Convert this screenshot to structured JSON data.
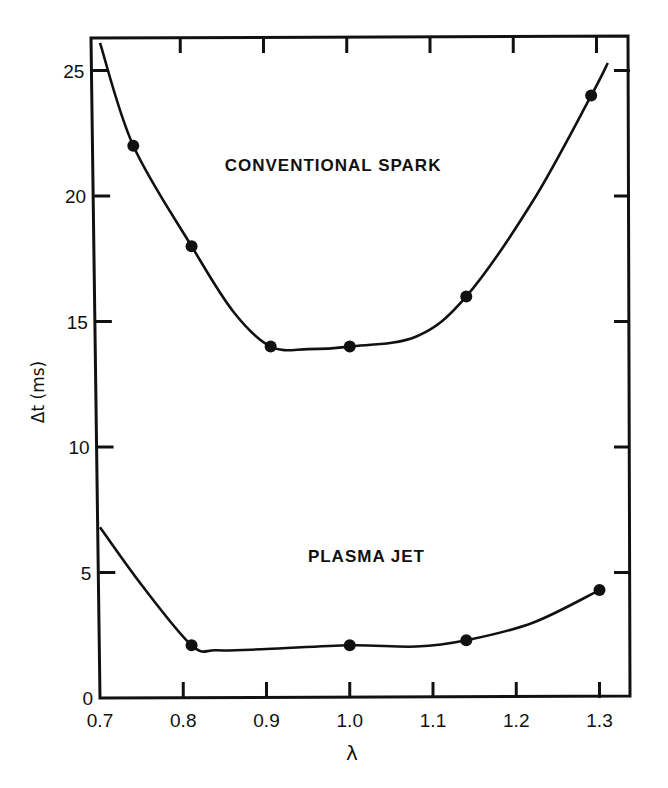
{
  "chart_data": {
    "type": "line",
    "title": "",
    "xlabel": "λ",
    "ylabel": "Δt (ms)",
    "xlim": [
      0.7,
      1.335
    ],
    "ylim": [
      0,
      26.5
    ],
    "x_ticks": [
      0.7,
      0.8,
      0.9,
      1.0,
      1.1,
      1.2,
      1.3
    ],
    "x_tick_labels": [
      "0.7",
      "0.8",
      "0.9",
      "1.0",
      "1.1",
      "1.2",
      "1.3"
    ],
    "y_ticks": [
      0,
      5,
      10,
      15,
      20,
      25
    ],
    "y_tick_labels": [
      "0",
      "5",
      "10",
      "15",
      "20",
      "25"
    ],
    "grid": false,
    "legend": "none (series labeled inline)",
    "series": [
      {
        "name": "CONVENTIONAL SPARK",
        "points": [
          {
            "x": 0.74,
            "y": 22.0
          },
          {
            "x": 0.81,
            "y": 18.0
          },
          {
            "x": 0.905,
            "y": 14.0
          },
          {
            "x": 1.0,
            "y": 14.0
          },
          {
            "x": 1.14,
            "y": 16.0
          },
          {
            "x": 1.29,
            "y": 24.0
          }
        ],
        "curve": [
          [
            0.7,
            26.1
          ],
          [
            0.74,
            22.0
          ],
          [
            0.81,
            18.0
          ],
          [
            0.86,
            15.4
          ],
          [
            0.905,
            14.0
          ],
          [
            0.95,
            13.9
          ],
          [
            1.0,
            14.0
          ],
          [
            1.08,
            14.4
          ],
          [
            1.14,
            16.0
          ],
          [
            1.22,
            19.8
          ],
          [
            1.29,
            24.0
          ],
          [
            1.31,
            25.3
          ]
        ]
      },
      {
        "name": "PLASMA JET",
        "points": [
          {
            "x": 0.81,
            "y": 2.1
          },
          {
            "x": 1.0,
            "y": 2.1
          },
          {
            "x": 1.14,
            "y": 2.3
          },
          {
            "x": 1.3,
            "y": 4.3
          }
        ],
        "curve": [
          [
            0.7,
            6.8
          ],
          [
            0.75,
            4.5
          ],
          [
            0.81,
            2.1
          ],
          [
            0.84,
            1.9
          ],
          [
            0.9,
            1.95
          ],
          [
            1.0,
            2.1
          ],
          [
            1.08,
            2.05
          ],
          [
            1.14,
            2.3
          ],
          [
            1.22,
            3.0
          ],
          [
            1.3,
            4.3
          ]
        ]
      }
    ],
    "annotations": [
      {
        "text": "CONVENTIONAL SPARK",
        "x": 0.98,
        "y": 21.0
      },
      {
        "text": "PLASMA JET",
        "x": 1.02,
        "y": 5.4
      }
    ]
  }
}
